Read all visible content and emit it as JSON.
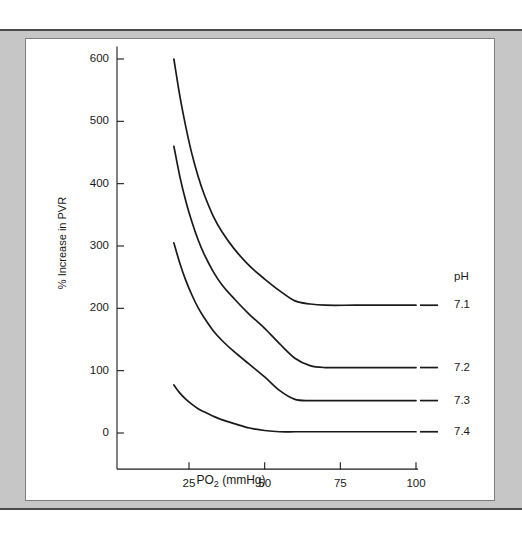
{
  "figure": {
    "background_color": "#c6c6c6",
    "card_color": "#ffffff",
    "line_color": "#1a1a1a"
  },
  "chart_data": {
    "type": "line",
    "title": "",
    "subtitle": "",
    "xlabel": "PO2 (mmHg)",
    "xlabel_base": "PO",
    "xlabel_sub": "2",
    "xlabel_rest": " (mmHg)",
    "ylabel": "% Increase in PVR",
    "xlim": [
      10,
      100
    ],
    "ylim": [
      -60,
      620
    ],
    "grid": false,
    "legend_position": "right",
    "legend_title": "pH",
    "xticks": [
      25,
      50,
      75,
      100
    ],
    "xtick_labels": [
      "25",
      "50",
      "75",
      "100"
    ],
    "yticks": [
      0,
      100,
      200,
      300,
      400,
      500,
      600
    ],
    "ytick_labels": [
      "0",
      "100",
      "200",
      "300",
      "400",
      "500",
      "600"
    ],
    "series": [
      {
        "name": "7.1",
        "label": "7.1",
        "plateau": 205,
        "x": [
          20,
          22,
          24,
          26,
          28,
          30,
          33,
          36,
          40,
          45,
          50,
          55,
          60,
          65,
          70,
          80,
          90,
          100
        ],
        "y": [
          600,
          540,
          490,
          447,
          412,
          383,
          348,
          322,
          295,
          268,
          247,
          228,
          212,
          207,
          205,
          205,
          205,
          205
        ]
      },
      {
        "name": "7.2",
        "label": "7.2",
        "plateau": 105,
        "x": [
          20,
          22,
          24,
          26,
          28,
          30,
          33,
          36,
          40,
          45,
          50,
          55,
          60,
          65,
          70,
          80,
          90,
          100
        ],
        "y": [
          460,
          411,
          371,
          338,
          310,
          287,
          259,
          237,
          215,
          190,
          168,
          143,
          120,
          108,
          105,
          105,
          105,
          105
        ]
      },
      {
        "name": "7.3",
        "label": "7.3",
        "plateau": 52,
        "x": [
          20,
          22,
          24,
          26,
          28,
          30,
          33,
          36,
          40,
          45,
          50,
          55,
          60,
          65,
          70,
          80,
          90,
          100
        ],
        "y": [
          305,
          272,
          244,
          221,
          201,
          185,
          164,
          148,
          130,
          110,
          90,
          68,
          54,
          52,
          52,
          52,
          52,
          52
        ]
      },
      {
        "name": "7.4",
        "label": "7.4",
        "plateau": 2,
        "x": [
          20,
          22,
          24,
          26,
          28,
          30,
          33,
          36,
          40,
          45,
          50,
          55,
          60,
          65,
          70,
          80,
          90,
          100
        ],
        "y": [
          77,
          64,
          54,
          46,
          39,
          34,
          27,
          21,
          15,
          8,
          4,
          2,
          2,
          2,
          2,
          2,
          2,
          2
        ]
      }
    ]
  }
}
